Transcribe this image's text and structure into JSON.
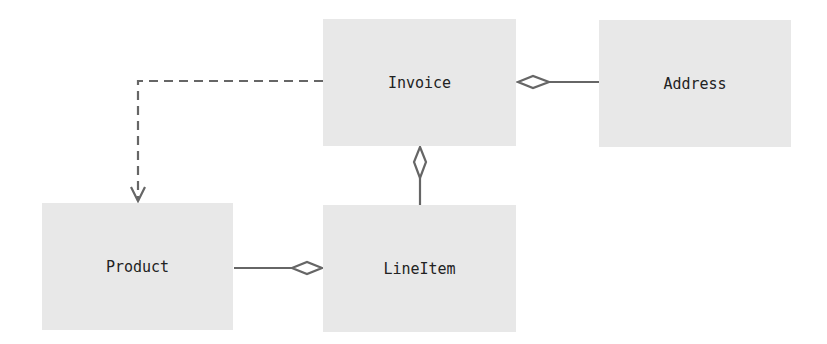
{
  "diagram": {
    "type": "UML class diagram",
    "colors": {
      "background": "#ffffff",
      "box_fill": "#e8e8e8",
      "line": "#666666",
      "text": "#222222"
    },
    "classes": [
      {
        "id": "invoice",
        "label": "Invoice",
        "x": 323,
        "y": 19,
        "w": 193,
        "h": 127
      },
      {
        "id": "address",
        "label": "Address",
        "x": 599,
        "y": 20,
        "w": 192,
        "h": 127
      },
      {
        "id": "product",
        "label": "Product",
        "x": 42,
        "y": 203,
        "w": 191,
        "h": 127
      },
      {
        "id": "lineitem",
        "label": "LineItem",
        "x": 323,
        "y": 205,
        "w": 193,
        "h": 127
      }
    ],
    "relationships": [
      {
        "from": "invoice",
        "to": "product",
        "kind": "dependency",
        "style": "dashed",
        "end": "open-arrow"
      },
      {
        "from": "address",
        "to": "invoice",
        "kind": "aggregation",
        "style": "solid",
        "end": "hollow-diamond-at-invoice"
      },
      {
        "from": "lineitem",
        "to": "invoice",
        "kind": "aggregation",
        "style": "solid",
        "end": "hollow-diamond-at-invoice"
      },
      {
        "from": "product",
        "to": "lineitem",
        "kind": "aggregation",
        "style": "solid",
        "end": "hollow-diamond-at-lineitem"
      }
    ]
  }
}
